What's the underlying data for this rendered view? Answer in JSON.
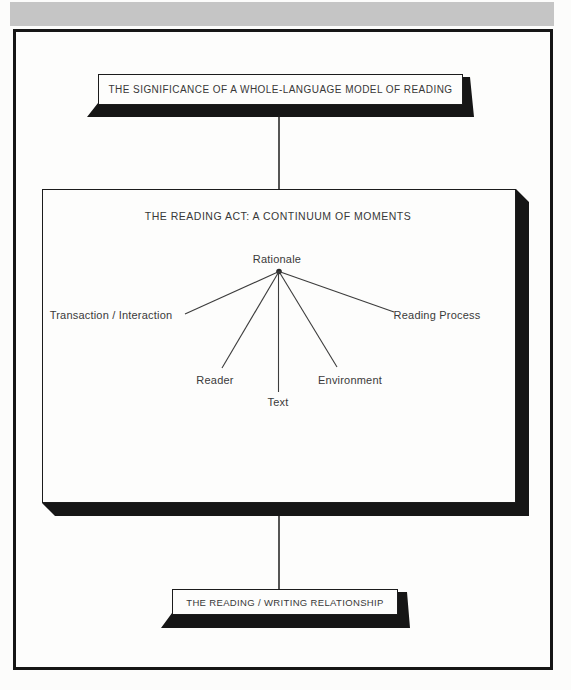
{
  "page": {
    "band_color": "#c5c5c5",
    "ink_color": "#161616",
    "line_color": "#3c3c3c",
    "text_color": "#383838",
    "paper_color": "#fdfdfc"
  },
  "diagram": {
    "top_box": {
      "label": "THE SIGNIFICANCE OF A WHOLE-LANGUAGE MODEL OF READING"
    },
    "middle_box": {
      "title": "THE READING ACT: A CONTINUUM OF MOMENTS",
      "hub_label": "Rationale",
      "spokes": [
        "Transaction / Interaction",
        "Reader",
        "Text",
        "Environment",
        "Reading Process"
      ]
    },
    "bottom_box": {
      "label": "THE READING / WRITING RELATIONSHIP"
    }
  }
}
